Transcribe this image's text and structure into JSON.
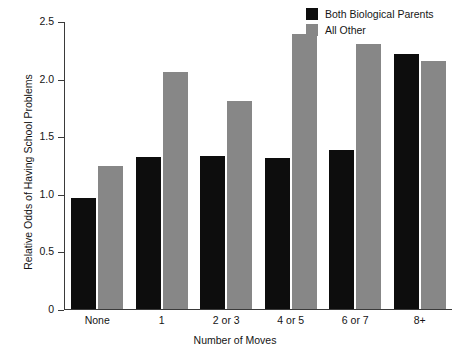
{
  "chart_data": {
    "type": "bar",
    "title": "",
    "xlabel": "Number of Moves",
    "ylabel": "Relative Odds of Having School Problems",
    "categories": [
      "None",
      "1",
      "2 or 3",
      "4 or 5",
      "6 or 7",
      "8+"
    ],
    "series": [
      {
        "name": "Both Biological Parents",
        "color": "#0d0d0d",
        "values": [
          0.96,
          1.32,
          1.33,
          1.31,
          1.38,
          2.21
        ]
      },
      {
        "name": "All Other",
        "color": "#878787",
        "values": [
          1.24,
          2.06,
          1.81,
          2.39,
          2.3,
          2.15
        ]
      }
    ],
    "ylim": [
      0,
      2.5
    ],
    "yticks": [
      0,
      0.5,
      1.0,
      1.5,
      2.0,
      2.5
    ],
    "ytick_labels": [
      "0",
      "0.5",
      "1.0",
      "1.5",
      "2.0",
      "2.5"
    ],
    "grid": false,
    "legend_position": "top-right"
  },
  "legend": {
    "entries": [
      {
        "label": "Both Biological Parents",
        "color": "#0d0d0d"
      },
      {
        "label": "All Other",
        "color": "#878787"
      }
    ]
  },
  "axes": {
    "x_title": "Number of Moves",
    "y_title": "Relative Odds of Having School Problems"
  }
}
